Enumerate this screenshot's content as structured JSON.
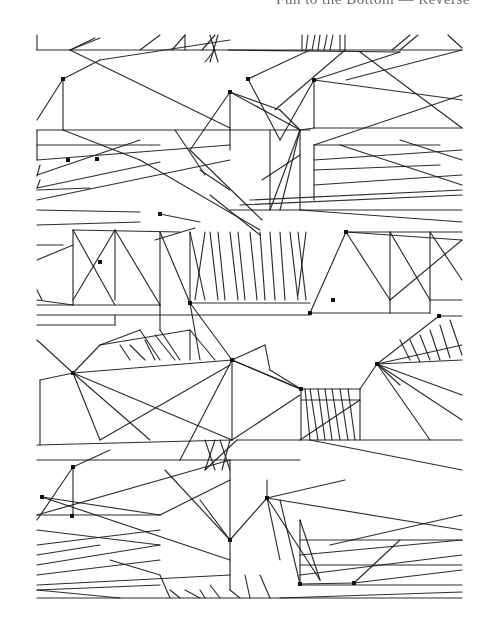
{
  "page": {
    "header_text": "Fun to the Bottom — Reverse",
    "background": "#ffffff",
    "ink": "#1a1a1a"
  },
  "artwork": {
    "description": "Generative computer line drawing: repeating tiles of straight segments, zigzag clusters and small node dots",
    "bounds": {
      "x": 37,
      "y": 35,
      "width": 425,
      "height": 563
    },
    "nodes": [
      [
        63,
        79
      ],
      [
        230,
        92
      ],
      [
        97,
        159
      ],
      [
        68,
        160
      ],
      [
        346,
        232
      ],
      [
        314,
        80
      ],
      [
        248,
        79
      ],
      [
        190,
        303
      ],
      [
        73,
        373
      ],
      [
        232,
        360
      ],
      [
        301,
        389
      ],
      [
        333,
        300
      ],
      [
        439,
        316
      ],
      [
        377,
        364
      ],
      [
        230,
        540
      ],
      [
        267,
        498
      ],
      [
        73,
        467
      ],
      [
        42,
        497
      ],
      [
        72,
        516
      ],
      [
        300,
        584
      ],
      [
        354,
        583
      ],
      [
        310,
        313
      ],
      [
        100,
        262
      ],
      [
        160,
        214
      ]
    ],
    "segments": [
      [
        37,
        50,
        462,
        50
      ],
      [
        37,
        35,
        37,
        50
      ],
      [
        70,
        50,
        100,
        38
      ],
      [
        70,
        50,
        95,
        38
      ],
      [
        140,
        50,
        160,
        35
      ],
      [
        172,
        50,
        185,
        35
      ],
      [
        185,
        50,
        185,
        35
      ],
      [
        202,
        50,
        215,
        35
      ],
      [
        218,
        35,
        210,
        62
      ],
      [
        210,
        35,
        218,
        62
      ],
      [
        205,
        62,
        215,
        50
      ],
      [
        228,
        50,
        400,
        52
      ],
      [
        302,
        35,
        302,
        50
      ],
      [
        308,
        35,
        306,
        50
      ],
      [
        315,
        35,
        312,
        50
      ],
      [
        320,
        35,
        318,
        50
      ],
      [
        327,
        35,
        324,
        50
      ],
      [
        333,
        35,
        330,
        50
      ],
      [
        340,
        35,
        340,
        50
      ],
      [
        345,
        35,
        345,
        50
      ],
      [
        392,
        50,
        410,
        35
      ],
      [
        400,
        50,
        418,
        35
      ],
      [
        448,
        35,
        462,
        48
      ],
      [
        37,
        130,
        37,
        160
      ],
      [
        37,
        130,
        230,
        130
      ],
      [
        63,
        79,
        63,
        130
      ],
      [
        63,
        79,
        37,
        120
      ],
      [
        63,
        79,
        100,
        60
      ],
      [
        70,
        50,
        230,
        128
      ],
      [
        100,
        60,
        230,
        40
      ],
      [
        37,
        145,
        160,
        145
      ],
      [
        37,
        160,
        230,
        145
      ],
      [
        37,
        175,
        140,
        140
      ],
      [
        63,
        130,
        140,
        160
      ],
      [
        37,
        188,
        160,
        162
      ],
      [
        37,
        200,
        230,
        160
      ],
      [
        40,
        165,
        37,
        176
      ],
      [
        40,
        180,
        37,
        188
      ],
      [
        37,
        190,
        90,
        188
      ],
      [
        230,
        92,
        230,
        150
      ],
      [
        230,
        92,
        280,
        110
      ],
      [
        230,
        92,
        190,
        150
      ],
      [
        230,
        92,
        300,
        130
      ],
      [
        230,
        130,
        310,
        130
      ],
      [
        190,
        150,
        262,
        220
      ],
      [
        140,
        160,
        260,
        230
      ],
      [
        175,
        130,
        205,
        175
      ],
      [
        200,
        170,
        230,
        190
      ],
      [
        210,
        195,
        260,
        235
      ],
      [
        160,
        214,
        200,
        222
      ],
      [
        155,
        240,
        195,
        228
      ],
      [
        248,
        79,
        280,
        140
      ],
      [
        248,
        79,
        310,
        50
      ],
      [
        275,
        110,
        345,
        50
      ],
      [
        280,
        140,
        314,
        80
      ],
      [
        314,
        80,
        314,
        128
      ],
      [
        314,
        128,
        462,
        128
      ],
      [
        280,
        110,
        300,
        130
      ],
      [
        300,
        130,
        314,
        128
      ],
      [
        314,
        80,
        462,
        100
      ],
      [
        314,
        80,
        400,
        52
      ],
      [
        346,
        80,
        462,
        50
      ],
      [
        360,
        52,
        462,
        128
      ],
      [
        314,
        145,
        440,
        145
      ],
      [
        314,
        145,
        462,
        95
      ],
      [
        314,
        160,
        462,
        150
      ],
      [
        314,
        170,
        440,
        165
      ],
      [
        314,
        185,
        462,
        175
      ],
      [
        314,
        145,
        314,
        200
      ],
      [
        400,
        140,
        462,
        160
      ],
      [
        340,
        145,
        462,
        185
      ],
      [
        270,
        130,
        270,
        210
      ],
      [
        262,
        180,
        300,
        155
      ],
      [
        270,
        210,
        300,
        130
      ],
      [
        280,
        210,
        300,
        130
      ],
      [
        300,
        130,
        300,
        210
      ],
      [
        230,
        210,
        462,
        210
      ],
      [
        240,
        205,
        462,
        195
      ],
      [
        250,
        200,
        462,
        190
      ],
      [
        300,
        210,
        462,
        222
      ],
      [
        37,
        210,
        140,
        212
      ],
      [
        37,
        225,
        140,
        222
      ],
      [
        37,
        245,
        63,
        245
      ],
      [
        37,
        260,
        73,
        245
      ],
      [
        73,
        230,
        73,
        305
      ],
      [
        73,
        230,
        180,
        232
      ],
      [
        73,
        230,
        115,
        305
      ],
      [
        115,
        230,
        115,
        300
      ],
      [
        115,
        230,
        73,
        300
      ],
      [
        160,
        232,
        160,
        305
      ],
      [
        115,
        230,
        160,
        305
      ],
      [
        160,
        232,
        190,
        303
      ],
      [
        37,
        300,
        73,
        305
      ],
      [
        37,
        305,
        160,
        305
      ],
      [
        37,
        290,
        42,
        300
      ],
      [
        190,
        232,
        190,
        303
      ],
      [
        190,
        232,
        205,
        300
      ],
      [
        205,
        232,
        195,
        300
      ],
      [
        210,
        232,
        218,
        300
      ],
      [
        218,
        232,
        225,
        300
      ],
      [
        230,
        232,
        238,
        300
      ],
      [
        238,
        232,
        245,
        300
      ],
      [
        250,
        232,
        257,
        300
      ],
      [
        260,
        232,
        265,
        300
      ],
      [
        270,
        232,
        275,
        300
      ],
      [
        280,
        232,
        285,
        300
      ],
      [
        290,
        232,
        298,
        300
      ],
      [
        298,
        232,
        306,
        300
      ],
      [
        306,
        232,
        298,
        295
      ],
      [
        190,
        303,
        310,
        303
      ],
      [
        346,
        232,
        310,
        313
      ],
      [
        346,
        232,
        390,
        300
      ],
      [
        390,
        232,
        390,
        313
      ],
      [
        390,
        232,
        430,
        300
      ],
      [
        430,
        232,
        462,
        280
      ],
      [
        430,
        232,
        430,
        313
      ],
      [
        346,
        232,
        462,
        232
      ],
      [
        346,
        232,
        462,
        240
      ],
      [
        390,
        300,
        462,
        240
      ],
      [
        310,
        313,
        430,
        313
      ],
      [
        430,
        300,
        462,
        300
      ],
      [
        37,
        315,
        310,
        315
      ],
      [
        37,
        325,
        115,
        325
      ],
      [
        115,
        315,
        115,
        325
      ],
      [
        160,
        305,
        160,
        330
      ],
      [
        37,
        340,
        73,
        373
      ],
      [
        73,
        373,
        100,
        345
      ],
      [
        100,
        345,
        140,
        330
      ],
      [
        100,
        345,
        190,
        330
      ],
      [
        190,
        330,
        190,
        360
      ],
      [
        140,
        330,
        160,
        360
      ],
      [
        160,
        330,
        180,
        360
      ],
      [
        120,
        345,
        130,
        360
      ],
      [
        130,
        345,
        145,
        360
      ],
      [
        145,
        340,
        155,
        360
      ],
      [
        155,
        335,
        175,
        360
      ],
      [
        190,
        330,
        215,
        360
      ],
      [
        73,
        373,
        232,
        360
      ],
      [
        73,
        373,
        100,
        440
      ],
      [
        73,
        373,
        150,
        440
      ],
      [
        73,
        373,
        232,
        440
      ],
      [
        73,
        373,
        40,
        380
      ],
      [
        40,
        380,
        40,
        445
      ],
      [
        37,
        445,
        232,
        440
      ],
      [
        100,
        440,
        230,
        365
      ],
      [
        232,
        360,
        180,
        460
      ],
      [
        232,
        360,
        232,
        440
      ],
      [
        232,
        360,
        300,
        389
      ],
      [
        190,
        303,
        232,
        360
      ],
      [
        190,
        303,
        200,
        360
      ],
      [
        232,
        360,
        301,
        389
      ],
      [
        232,
        440,
        300,
        395
      ],
      [
        301,
        389,
        301,
        440
      ],
      [
        301,
        389,
        360,
        389
      ],
      [
        301,
        389,
        270,
        370
      ],
      [
        270,
        370,
        265,
        345
      ],
      [
        265,
        345,
        232,
        360
      ],
      [
        301,
        400,
        360,
        400
      ],
      [
        305,
        389,
        310,
        440
      ],
      [
        310,
        389,
        318,
        440
      ],
      [
        318,
        389,
        325,
        440
      ],
      [
        325,
        389,
        332,
        440
      ],
      [
        332,
        389,
        340,
        440
      ],
      [
        340,
        389,
        348,
        440
      ],
      [
        348,
        389,
        355,
        440
      ],
      [
        360,
        389,
        360,
        440
      ],
      [
        360,
        389,
        377,
        364
      ],
      [
        377,
        364,
        439,
        316
      ],
      [
        377,
        364,
        462,
        345
      ],
      [
        377,
        364,
        462,
        360
      ],
      [
        377,
        364,
        462,
        395
      ],
      [
        377,
        364,
        430,
        440
      ],
      [
        377,
        364,
        462,
        420
      ],
      [
        377,
        364,
        400,
        385
      ],
      [
        400,
        340,
        410,
        360
      ],
      [
        410,
        340,
        420,
        362
      ],
      [
        420,
        335,
        430,
        360
      ],
      [
        430,
        330,
        440,
        360
      ],
      [
        440,
        325,
        450,
        358
      ],
      [
        450,
        320,
        462,
        355
      ],
      [
        439,
        316,
        462,
        316
      ],
      [
        237,
        440,
        462,
        440
      ],
      [
        300,
        440,
        360,
        400
      ],
      [
        310,
        440,
        462,
        470
      ],
      [
        37,
        460,
        300,
        460
      ],
      [
        237,
        440,
        205,
        470
      ],
      [
        205,
        440,
        215,
        470
      ],
      [
        215,
        440,
        205,
        470
      ],
      [
        220,
        440,
        230,
        470
      ],
      [
        230,
        440,
        222,
        470
      ],
      [
        73,
        467,
        73,
        515
      ],
      [
        73,
        467,
        37,
        520
      ],
      [
        73,
        467,
        110,
        450
      ],
      [
        37,
        515,
        160,
        515
      ],
      [
        37,
        515,
        230,
        460
      ],
      [
        42,
        497,
        160,
        515
      ],
      [
        37,
        530,
        160,
        545
      ],
      [
        37,
        545,
        160,
        530
      ],
      [
        37,
        555,
        100,
        545
      ],
      [
        37,
        565,
        160,
        545
      ],
      [
        37,
        575,
        160,
        560
      ],
      [
        37,
        585,
        230,
        575
      ],
      [
        37,
        590,
        160,
        585
      ],
      [
        42,
        497,
        230,
        560
      ],
      [
        160,
        515,
        230,
        480
      ],
      [
        230,
        460,
        230,
        540
      ],
      [
        230,
        540,
        267,
        498
      ],
      [
        267,
        498,
        267,
        480
      ],
      [
        230,
        540,
        165,
        470
      ],
      [
        230,
        540,
        230,
        590
      ],
      [
        200,
        500,
        230,
        540
      ],
      [
        267,
        498,
        345,
        480
      ],
      [
        267,
        498,
        280,
        560
      ],
      [
        267,
        498,
        320,
        580
      ],
      [
        267,
        498,
        462,
        530
      ],
      [
        280,
        500,
        300,
        584
      ],
      [
        300,
        520,
        300,
        584
      ],
      [
        300,
        520,
        320,
        580
      ],
      [
        300,
        584,
        354,
        583
      ],
      [
        300,
        540,
        462,
        540
      ],
      [
        300,
        555,
        462,
        540
      ],
      [
        300,
        565,
        462,
        565
      ],
      [
        300,
        575,
        462,
        555
      ],
      [
        300,
        585,
        462,
        585
      ],
      [
        330,
        545,
        462,
        515
      ],
      [
        354,
        583,
        462,
        570
      ],
      [
        354,
        583,
        400,
        540
      ],
      [
        110,
        560,
        160,
        575
      ],
      [
        160,
        575,
        170,
        598
      ],
      [
        170,
        590,
        180,
        598
      ],
      [
        185,
        590,
        200,
        598
      ],
      [
        200,
        590,
        205,
        598
      ],
      [
        210,
        585,
        220,
        598
      ],
      [
        230,
        590,
        240,
        598
      ],
      [
        245,
        575,
        250,
        598
      ],
      [
        260,
        575,
        270,
        598
      ],
      [
        37,
        598,
        462,
        598
      ],
      [
        37,
        590,
        120,
        598
      ],
      [
        280,
        598,
        462,
        592
      ]
    ]
  }
}
